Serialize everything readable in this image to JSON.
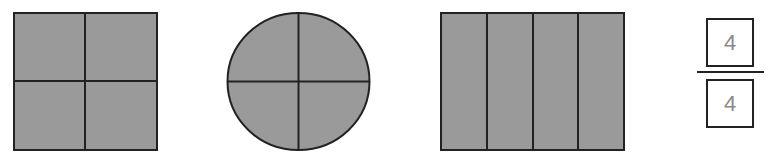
{
  "diagram": {
    "fill_color": "#9a9a9a",
    "stroke_color": "#222222",
    "shapes": [
      {
        "name": "square",
        "parts": 4,
        "shaded": 4,
        "division": "2x2 grid"
      },
      {
        "name": "circle",
        "parts": 4,
        "shaded": 4,
        "division": "quarters"
      },
      {
        "name": "rectangle",
        "parts": 4,
        "shaded": 4,
        "division": "4 vertical strips"
      }
    ],
    "fraction": {
      "numerator": "4",
      "denominator": "4"
    }
  }
}
